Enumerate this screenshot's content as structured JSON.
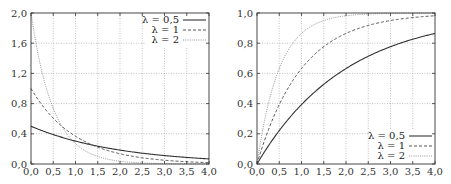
{
  "chart_data": [
    {
      "type": "line",
      "title": "",
      "xlabel": "",
      "ylabel": "",
      "description": "Exponential distribution probability density f(x) = λ·e^(−λx)",
      "x": [
        0.0,
        0.5,
        1.0,
        1.5,
        2.0,
        2.5,
        3.0,
        3.5,
        4.0
      ],
      "xlim": [
        0.0,
        4.0
      ],
      "ylim": [
        0.0,
        2.0
      ],
      "xticks": [
        "0,0",
        "0,5",
        "1,0",
        "1,5",
        "2,0",
        "2,5",
        "3,0",
        "3,5",
        "4,0"
      ],
      "yticks": [
        "0,0",
        "0,4",
        "0,8",
        "1,2",
        "1,6",
        "2,0"
      ],
      "xtick_values": [
        0,
        0.5,
        1,
        1.5,
        2,
        2.5,
        3,
        3.5,
        4
      ],
      "ytick_values": [
        0,
        0.4,
        0.8,
        1.2,
        1.6,
        2.0
      ],
      "grid": true,
      "legend_position": "upper right",
      "series": [
        {
          "name": "λ = 0,5",
          "lambda": 0.5,
          "style": "solid",
          "values": [
            0.5,
            0.389,
            0.303,
            0.236,
            0.184,
            0.143,
            0.112,
            0.087,
            0.068
          ]
        },
        {
          "name": "λ = 1",
          "lambda": 1,
          "style": "dashed",
          "values": [
            1.0,
            0.607,
            0.368,
            0.223,
            0.135,
            0.082,
            0.05,
            0.03,
            0.018
          ]
        },
        {
          "name": "λ = 2",
          "lambda": 2,
          "style": "dotted",
          "values": [
            2.0,
            0.736,
            0.271,
            0.1,
            0.037,
            0.013,
            0.005,
            0.002,
            0.001
          ]
        }
      ]
    },
    {
      "type": "line",
      "title": "",
      "xlabel": "",
      "ylabel": "",
      "description": "Exponential distribution cumulative distribution F(x) = 1 − e^(−λx)",
      "x": [
        0.0,
        0.5,
        1.0,
        1.5,
        2.0,
        2.5,
        3.0,
        3.5,
        4.0
      ],
      "xlim": [
        0.0,
        4.0
      ],
      "ylim": [
        0.0,
        1.0
      ],
      "xticks": [
        "0,0",
        "0,5",
        "1,0",
        "1,5",
        "2,0",
        "2,5",
        "3,0",
        "3,5",
        "4,0"
      ],
      "yticks": [
        "0,0",
        "0,2",
        "0,4",
        "0,6",
        "0,8",
        "1,0"
      ],
      "xtick_values": [
        0,
        0.5,
        1,
        1.5,
        2,
        2.5,
        3,
        3.5,
        4
      ],
      "ytick_values": [
        0,
        0.2,
        0.4,
        0.6,
        0.8,
        1.0
      ],
      "grid": true,
      "legend_position": "lower right",
      "series": [
        {
          "name": "λ = 0,5",
          "lambda": 0.5,
          "style": "solid",
          "values": [
            0.0,
            0.221,
            0.393,
            0.528,
            0.632,
            0.713,
            0.777,
            0.826,
            0.865
          ]
        },
        {
          "name": "λ = 1",
          "lambda": 1,
          "style": "dashed",
          "values": [
            0.0,
            0.393,
            0.632,
            0.777,
            0.865,
            0.918,
            0.95,
            0.97,
            0.982
          ]
        },
        {
          "name": "λ = 2",
          "lambda": 2,
          "style": "dotted",
          "values": [
            0.0,
            0.632,
            0.865,
            0.95,
            0.982,
            0.993,
            0.998,
            0.999,
            1.0
          ]
        }
      ]
    }
  ],
  "colors": {
    "axis": "#333333",
    "grid": "#9a9a9a",
    "solid": "#333333",
    "dashed": "#444444",
    "dotted": "#8a8a8a"
  }
}
